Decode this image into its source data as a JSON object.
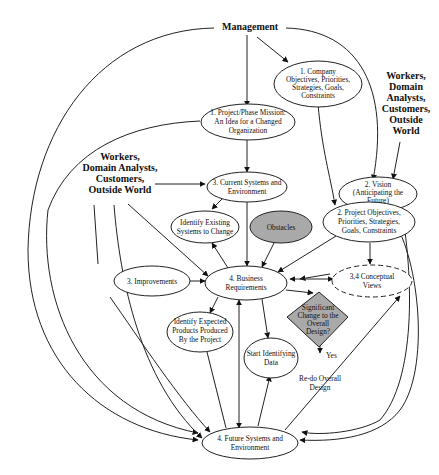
{
  "diagram": {
    "actors": {
      "management": "Management",
      "workers_right": [
        "Workers,",
        "Domain",
        "Analysts,",
        "Customers,",
        "Outside",
        "World"
      ],
      "workers_left": [
        "Workers,",
        "Domain Analysts,",
        "Customers,",
        "Outside World"
      ]
    },
    "nodes": {
      "company_objectives": [
        "1. Company",
        "Objectives, Priorities,",
        "Strategies, Goals,",
        "Constraints"
      ],
      "project_mission": [
        "1. Project/Phase Mission:",
        "An Idea for a Changed",
        "Organization"
      ],
      "vision": [
        "2. Vision",
        "(Anticipating the",
        "Future)"
      ],
      "project_objectives": [
        "2. Project Objectives,",
        "Priorities, Strategies,",
        "Goals, Constraints"
      ],
      "current_systems": [
        "3. Current Systems and",
        "Environment"
      ],
      "identify_existing": [
        "Identify Existing",
        "Systems to Change"
      ],
      "obstacles": [
        "Obstacles"
      ],
      "improvements": [
        "3. Improvements"
      ],
      "business_requirements": [
        "4. Business",
        "Requirements"
      ],
      "conceptual_views": [
        "3,4 Conceptual",
        "Views"
      ],
      "significant_change": [
        "Significant",
        "Change to the",
        "Overall",
        "Design?"
      ],
      "yes_label": "Yes",
      "redo_design": [
        "Re-do Overall",
        "Design"
      ],
      "identify_expected": [
        "Identify Expected",
        "Products Produced",
        "By the Project"
      ],
      "start_identifying": [
        "Start Identifying",
        "Data"
      ],
      "future_systems": [
        "4. Future Systems and",
        "Environment"
      ]
    }
  }
}
